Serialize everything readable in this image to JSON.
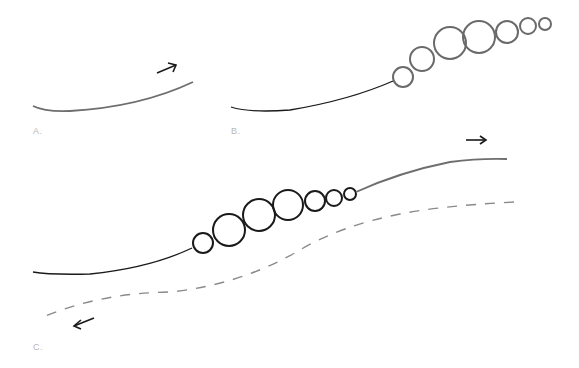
{
  "panels": [
    {
      "id": "A",
      "label": "A.",
      "description": "single curved line rising to the right with arrow pointing up-right"
    },
    {
      "id": "B",
      "label": "B.",
      "description": "curved line transitioning into a chain of seven bubbles of varying size"
    },
    {
      "id": "C",
      "label": "C.",
      "description": "solid line with bubble chain continuing right (arrow right) and dashed return line going left (arrow left)"
    }
  ],
  "colors": {
    "stroke_dark": "#1a1a1a",
    "stroke_gray": "#6e6e6e",
    "dashed": "#8a8a8a",
    "label": "#b8b8b8"
  }
}
